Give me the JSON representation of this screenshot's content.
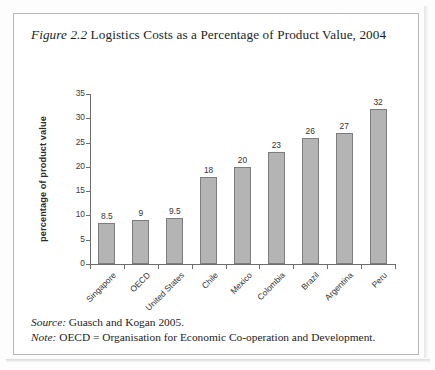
{
  "figure": {
    "label": "Figure 2.2",
    "title_rest": " Logistics Costs as a Percentage of Product Value, 2004",
    "source_label": "Source:",
    "source_text": " Guasch and Kogan 2005.",
    "note_label": "Note:",
    "note_text": " OECD = Organisation for Economic Co-operation and Development."
  },
  "chart_data": {
    "type": "bar",
    "title": "Figure 2.2 Logistics Costs as a Percentage of Product Value, 2004",
    "xlabel": "",
    "ylabel": "percentage of product value",
    "ylim": [
      0,
      35
    ],
    "yticks": [
      0,
      5,
      10,
      15,
      20,
      25,
      30,
      35
    ],
    "ytick_labels": [
      "0",
      "5",
      "10",
      "15",
      "20",
      "25",
      "30",
      "35"
    ],
    "grid": false,
    "legend": false,
    "bar_color": "#b4b4b4",
    "bar_edge_color": "#7d7d7d",
    "categories": [
      "Singapore",
      "OECD",
      "United States",
      "Chile",
      "Mexico",
      "Colombia",
      "Brazil",
      "Argentina",
      "Peru"
    ],
    "values": [
      8.5,
      9,
      9.5,
      18,
      20,
      23,
      26,
      27,
      32
    ],
    "value_labels": [
      "8.5",
      "9",
      "9.5",
      "18",
      "20",
      "23",
      "26",
      "27",
      "32"
    ]
  }
}
